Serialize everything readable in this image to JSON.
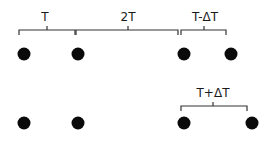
{
  "diagram": {
    "rows": [
      {
        "name": "top-row",
        "dots": 4,
        "intervals": [
          {
            "label": "T"
          },
          {
            "label": "2T"
          },
          {
            "label": "T-ΔT"
          }
        ]
      },
      {
        "name": "bottom-row",
        "dots": 4,
        "intervals": [
          {
            "label": "T+ΔT"
          }
        ]
      }
    ],
    "colors": {
      "dot": "#0a0a0a",
      "bracket": "#333333",
      "text": "#1a1a1a"
    }
  }
}
